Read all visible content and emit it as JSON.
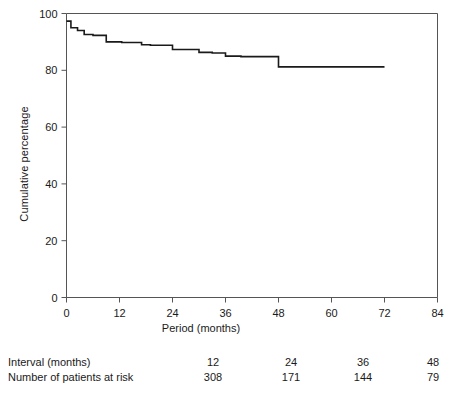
{
  "chart_data": {
    "type": "line",
    "subtype": "kaplan-meier-step",
    "title": "",
    "xlabel": "Period (months)",
    "ylabel": "Cumulative percentage",
    "xlim": [
      0,
      84
    ],
    "ylim": [
      0,
      100
    ],
    "xticks": [
      0,
      12,
      24,
      36,
      48,
      60,
      72,
      84
    ],
    "xticklabels": [
      "0",
      "12",
      "24",
      "36",
      "48",
      "60",
      "72",
      "84"
    ],
    "yticks": [
      0,
      20,
      40,
      60,
      80,
      100
    ],
    "yticklabels": [
      "0",
      "20",
      "40",
      "60",
      "80",
      "100"
    ],
    "grid": false,
    "legend": false,
    "series": [
      {
        "name": "Cumulative survival",
        "color": "#1a1a1a",
        "x": [
          0,
          1,
          1,
          2.5,
          2.5,
          4,
          4,
          6,
          6,
          9,
          9,
          12.5,
          12.5,
          17,
          17,
          19,
          19,
          24,
          24,
          30,
          30,
          33,
          33,
          36,
          36,
          39.5,
          39.5,
          48,
          48,
          72
        ],
        "y": [
          97.3,
          97.3,
          95.0,
          95.0,
          94.0,
          94.0,
          92.6,
          92.6,
          92.3,
          92.3,
          90.0,
          90.0,
          89.8,
          89.8,
          89.0,
          89.0,
          88.8,
          88.8,
          87.3,
          87.3,
          86.3,
          86.3,
          86.1,
          86.1,
          85.0,
          85.0,
          84.8,
          84.8,
          81.2,
          81.2
        ],
        "points": [
          {
            "x": 0,
            "y": 97.3
          },
          {
            "x": 1,
            "y": 95.0
          },
          {
            "x": 2.5,
            "y": 94.0
          },
          {
            "x": 4,
            "y": 92.6
          },
          {
            "x": 6,
            "y": 92.3
          },
          {
            "x": 9,
            "y": 90.0
          },
          {
            "x": 12.5,
            "y": 89.8
          },
          {
            "x": 17,
            "y": 89.0
          },
          {
            "x": 19,
            "y": 88.8
          },
          {
            "x": 24,
            "y": 87.3
          },
          {
            "x": 30,
            "y": 86.3
          },
          {
            "x": 33,
            "y": 86.1
          },
          {
            "x": 36,
            "y": 85.0
          },
          {
            "x": 39.5,
            "y": 84.8
          },
          {
            "x": 48,
            "y": 81.2
          },
          {
            "x": 72,
            "y": 81.2
          }
        ]
      }
    ]
  },
  "risk_table": {
    "rows": [
      {
        "label": "Interval (months)",
        "values": [
          "12",
          "24",
          "36",
          "48",
          "60"
        ]
      },
      {
        "label": "Number of patients at risk",
        "values": [
          "308",
          "171",
          "144",
          "79",
          "32"
        ]
      }
    ]
  },
  "colors": {
    "curve": "#1a1a1a",
    "axis": "#555555",
    "text": "#1a1a1a",
    "background": "#ffffff"
  }
}
